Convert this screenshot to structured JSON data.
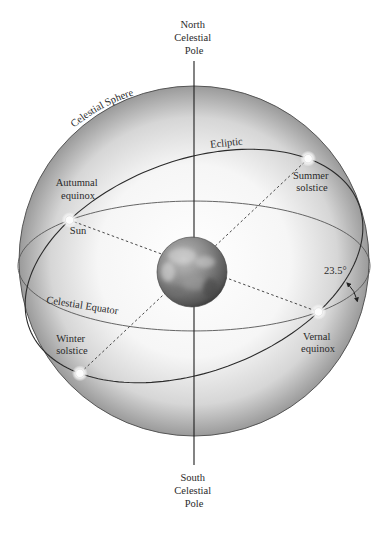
{
  "labels": {
    "north_pole": [
      "North",
      "Celestial",
      "Pole"
    ],
    "south_pole": [
      "South",
      "Celestial",
      "Pole"
    ],
    "celestial_sphere": "Celestial Sphere",
    "ecliptic": "Ecliptic",
    "celestial_equator": "Celestial Equator",
    "autumnal_equinox": [
      "Autumnal",
      "equinox"
    ],
    "sun": "Sun",
    "summer_solstice": [
      "Summer",
      "solstice"
    ],
    "vernal_equinox": [
      "Vernal",
      "equinox"
    ],
    "winter_solstice": [
      "Winter",
      "solstice"
    ],
    "tilt_angle": "23.5°"
  },
  "geometry_facts": {
    "ecliptic_tilt_degrees": 23.5
  },
  "objects": [
    {
      "name": "earth",
      "label": ""
    },
    {
      "name": "sun-autumnal-equinox",
      "label": "Sun"
    },
    {
      "name": "summer-solstice-point",
      "label": "Summer solstice"
    },
    {
      "name": "vernal-equinox-point",
      "label": "Vernal equinox"
    },
    {
      "name": "winter-solstice-point",
      "label": "Winter solstice"
    }
  ],
  "colors": {
    "line": "#2b2b2b",
    "sphere_edge": "#555555",
    "sphere_light": "#ffffff",
    "sphere_dark": "#8e8e8e",
    "earth_light": "#c9c9c9",
    "earth_dark": "#3a3a3a"
  }
}
